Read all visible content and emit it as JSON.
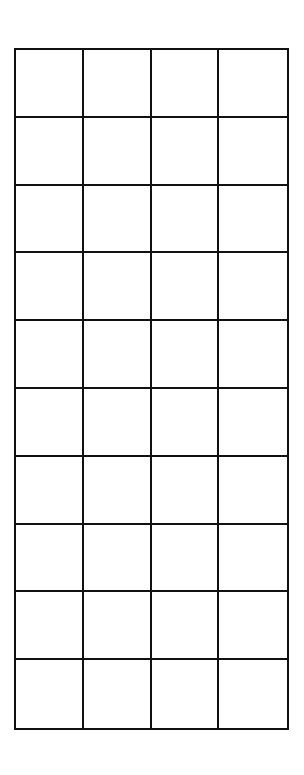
{
  "grid": {
    "rows": 10,
    "columns": 4,
    "line_color": "#111111",
    "background_color": "#ffffff",
    "cells": [
      [
        "",
        "",
        "",
        ""
      ],
      [
        "",
        "",
        "",
        ""
      ],
      [
        "",
        "",
        "",
        ""
      ],
      [
        "",
        "",
        "",
        ""
      ],
      [
        "",
        "",
        "",
        ""
      ],
      [
        "",
        "",
        "",
        ""
      ],
      [
        "",
        "",
        "",
        ""
      ],
      [
        "",
        "",
        "",
        ""
      ],
      [
        "",
        "",
        "",
        ""
      ],
      [
        "",
        "",
        "",
        ""
      ]
    ]
  }
}
